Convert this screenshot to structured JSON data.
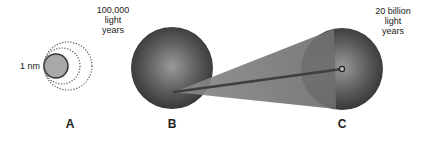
{
  "diagram": {
    "panels": [
      {
        "id": "A",
        "label": "A",
        "size_label": "1 nm"
      },
      {
        "id": "B",
        "label": "B",
        "size_label": [
          "100,000",
          "light",
          "years"
        ]
      },
      {
        "id": "C",
        "label": "C",
        "size_label": [
          "20 billion",
          "light",
          "years"
        ]
      }
    ],
    "colors": {
      "sphere_dark": "#3a3a3a",
      "sphere_light": "#8c8c8c",
      "circle_a_fill": "#a8a8a8",
      "cone": "#7a7a7a",
      "rod": "#404040",
      "text": "#222222"
    }
  }
}
